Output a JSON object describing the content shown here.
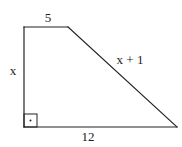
{
  "diagram": {
    "type": "right trapezoid",
    "vertices": {
      "top_left": [
        24,
        27
      ],
      "top_right": [
        68,
        27
      ],
      "bottom_right": [
        177,
        127
      ],
      "bottom_left": [
        24,
        127
      ]
    },
    "sides": {
      "top": {
        "label": "5"
      },
      "left": {
        "label": "x"
      },
      "slanted": {
        "label": "x + 1"
      },
      "bottom": {
        "label": "12"
      }
    },
    "right_angle_marker": {
      "corner": "bottom_left",
      "has_dot": true
    },
    "colors": {
      "line": "#222222",
      "background": "#ffffff"
    }
  }
}
